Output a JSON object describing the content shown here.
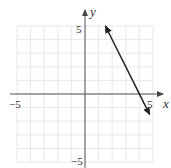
{
  "chart_data": {
    "type": "line",
    "title": "",
    "xlabel": "x",
    "ylabel": "y",
    "xlim": [
      -5,
      5
    ],
    "ylim": [
      -5,
      5
    ],
    "grid": true,
    "grid_step": 1,
    "x_tick_labels": [
      "−5",
      "5"
    ],
    "y_tick_labels": [
      "5",
      "−5"
    ],
    "series": [
      {
        "name": "line",
        "equation": "y = -2x + 8",
        "slope": -2,
        "y_intercept": 8,
        "x_intercept": 4,
        "arrows": "both",
        "points": [
          [
            1.5,
            5
          ],
          [
            4.75,
            -1.5
          ]
        ]
      }
    ],
    "legend": null
  },
  "axes": {
    "x_label": "x",
    "y_label": "y",
    "x_min_label": "−5",
    "x_max_label": "5",
    "y_max_label": "5",
    "y_min_label": "−5"
  },
  "colors": {
    "grid": "#e2e2e2",
    "axis": "#555555",
    "line": "#222222"
  }
}
